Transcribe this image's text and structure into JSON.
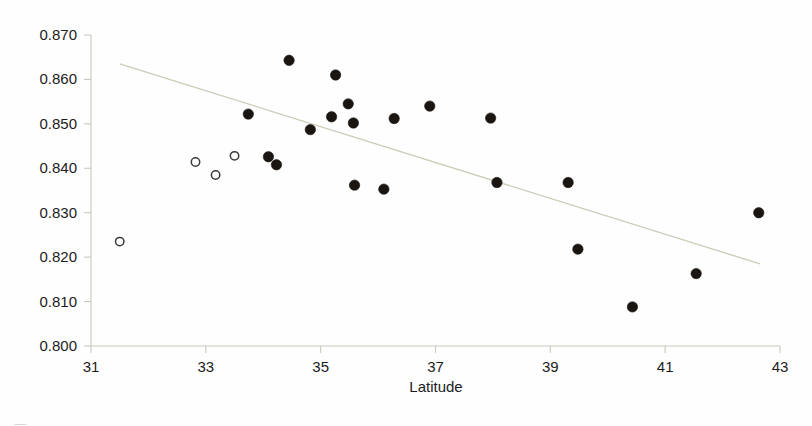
{
  "figure": {
    "background_color": "#fefefe",
    "marker_filled_color": "#1a1511",
    "marker_open_color": "#ffffff",
    "marker_open_edge_color": "#3b3b38",
    "trend_line_color": "#cdcbb6",
    "axis_color": "#c9c9bd",
    "partial_caption": "—"
  },
  "chart_data": {
    "type": "scatter",
    "title": "",
    "xlabel": "Latitude",
    "ylabel": "",
    "xlim": [
      31,
      43
    ],
    "ylim": [
      0.8,
      0.87
    ],
    "grid": false,
    "legend": "none",
    "xticks": [
      31,
      33,
      35,
      37,
      39,
      41,
      43
    ],
    "xtick_labels": [
      "31",
      "33",
      "35",
      "37",
      "39",
      "41",
      "43"
    ],
    "yticks": [
      0.8,
      0.81,
      0.82,
      0.83,
      0.84,
      0.85,
      0.86,
      0.87
    ],
    "ytick_labels": [
      "0.800",
      "0.810",
      "0.820",
      "0.830",
      "0.840",
      "0.850",
      "0.860",
      "0.870"
    ],
    "series": [
      {
        "name": "filled",
        "marker": "filled-circle",
        "points": [
          {
            "x": 33.74,
            "y": 0.8522
          },
          {
            "x": 34.09,
            "y": 0.8426
          },
          {
            "x": 34.23,
            "y": 0.8408
          },
          {
            "x": 34.45,
            "y": 0.8643
          },
          {
            "x": 34.82,
            "y": 0.8487
          },
          {
            "x": 35.26,
            "y": 0.861
          },
          {
            "x": 35.19,
            "y": 0.8516
          },
          {
            "x": 35.48,
            "y": 0.8545
          },
          {
            "x": 35.57,
            "y": 0.8502
          },
          {
            "x": 35.59,
            "y": 0.8362
          },
          {
            "x": 36.1,
            "y": 0.8353
          },
          {
            "x": 36.28,
            "y": 0.8512
          },
          {
            "x": 36.9,
            "y": 0.854
          },
          {
            "x": 37.96,
            "y": 0.8513
          },
          {
            "x": 38.07,
            "y": 0.8368
          },
          {
            "x": 39.31,
            "y": 0.8368
          },
          {
            "x": 39.48,
            "y": 0.8218
          },
          {
            "x": 40.43,
            "y": 0.8088
          },
          {
            "x": 41.54,
            "y": 0.8163
          },
          {
            "x": 42.63,
            "y": 0.83
          }
        ]
      },
      {
        "name": "open",
        "marker": "open-circle",
        "points": [
          {
            "x": 31.5,
            "y": 0.8235
          },
          {
            "x": 32.82,
            "y": 0.8414
          },
          {
            "x": 33.17,
            "y": 0.8385
          },
          {
            "x": 33.5,
            "y": 0.8428
          }
        ]
      }
    ],
    "trend_line": {
      "x_start": 31.5,
      "y_start": 0.8635,
      "x_end": 42.65,
      "y_end": 0.8185
    }
  }
}
